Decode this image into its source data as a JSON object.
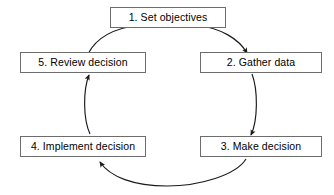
{
  "diagram": {
    "type": "cycle",
    "background_color": "#ffffff",
    "line_color": "#1a1a1a",
    "box_border_color": "#6d6d6d",
    "box_fill_color": "#ffffff",
    "text_color": "#000000",
    "nodes": [
      {
        "id": "1",
        "label": "1. Set objectives",
        "position": "top"
      },
      {
        "id": "2",
        "label": "2. Gather data",
        "position": "right-upper"
      },
      {
        "id": "3",
        "label": "3. Make decision",
        "position": "right-lower"
      },
      {
        "id": "4",
        "label": "4. Implement decision",
        "position": "left-lower"
      },
      {
        "id": "5",
        "label": "5. Review decision",
        "position": "left-upper"
      }
    ],
    "connectors": [
      {
        "id": "c1",
        "from": "1",
        "to": "2",
        "style": "curved-arc",
        "direction": "clockwise"
      },
      {
        "id": "c2",
        "from": "2",
        "to": "3",
        "style": "curved-arc",
        "direction": "downward"
      },
      {
        "id": "c3",
        "from": "3",
        "to": "4",
        "style": "curved-arc",
        "direction": "leftward"
      },
      {
        "id": "c4",
        "from": "4",
        "to": "5",
        "style": "curved-arc",
        "direction": "upward"
      },
      {
        "id": "c5",
        "from": "5",
        "to": "1",
        "style": "curved-arc",
        "direction": "clockwise"
      }
    ]
  }
}
